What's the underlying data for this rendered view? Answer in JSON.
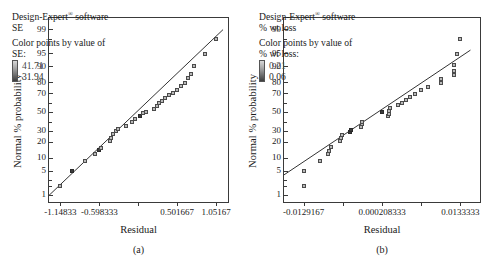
{
  "figure": {
    "panels": [
      {
        "id": "a",
        "caption": "(a)",
        "legend": {
          "software_pre": "Design-Expert",
          "software_sup": "®",
          "software_post": " software",
          "response": "SE",
          "color_by_line1": "Color points by value of",
          "color_by_line2": "SE:",
          "grad_high": "41.71",
          "grad_low": "31.94"
        },
        "chart_data": {
          "type": "scatter",
          "title": "Normal plot of residuals — SE",
          "xlabel": "Residual",
          "ylabel": "Normal % probability",
          "xticklabels": [
            "-1.14833",
            "-0.598333",
            "",
            "0.501667",
            "1.05167"
          ],
          "xtickvalues": [
            -1.14833,
            -0.598333,
            -0.0483333,
            0.501667,
            1.05167
          ],
          "yticklabels": [
            "99",
            "95",
            "90",
            "80",
            "70",
            "50",
            "30",
            "20",
            "10",
            "5",
            "1"
          ],
          "ytickvalues": [
            99,
            95,
            90,
            80,
            70,
            50,
            30,
            20,
            10,
            5,
            1
          ],
          "xlim": [
            -1.31,
            1.22
          ],
          "ylim": [
            0.6,
            99.6
          ],
          "grid": false,
          "legend_position": "top-left",
          "reference_line": {
            "x": [
              -1.31,
              1.15
            ],
            "y": [
              1.0,
              99.0
            ]
          },
          "points": [
            {
              "x": -1.14833,
              "y": 2.0,
              "shade": "mid"
            },
            {
              "x": -0.98,
              "y": 5.0,
              "shade": "dark"
            },
            {
              "x": -0.8,
              "y": 8.5,
              "shade": "mid"
            },
            {
              "x": -0.66,
              "y": 12.0,
              "shade": "mid"
            },
            {
              "x": -0.61,
              "y": 14.5,
              "shade": "dark"
            },
            {
              "x": -0.58,
              "y": 16.0,
              "shade": "mid"
            },
            {
              "x": -0.45,
              "y": 21.0,
              "shade": "mid"
            },
            {
              "x": -0.43,
              "y": 24.0,
              "shade": "mid"
            },
            {
              "x": -0.4,
              "y": 27.0,
              "shade": "mid"
            },
            {
              "x": -0.37,
              "y": 30.0,
              "shade": "mid"
            },
            {
              "x": -0.33,
              "y": 32.5,
              "shade": "mid"
            },
            {
              "x": -0.22,
              "y": 35.5,
              "shade": "mid"
            },
            {
              "x": -0.14,
              "y": 39.0,
              "shade": "mid"
            },
            {
              "x": -0.1,
              "y": 42.5,
              "shade": "mid"
            },
            {
              "x": -0.03,
              "y": 46.5,
              "shade": "dark"
            },
            {
              "x": 0.02,
              "y": 49.0,
              "shade": "mid"
            },
            {
              "x": 0.06,
              "y": 50.5,
              "shade": "mid"
            },
            {
              "x": 0.17,
              "y": 53.5,
              "shade": "mid"
            },
            {
              "x": 0.21,
              "y": 57.0,
              "shade": "mid"
            },
            {
              "x": 0.25,
              "y": 60.0,
              "shade": "mid"
            },
            {
              "x": 0.29,
              "y": 62.5,
              "shade": "mid"
            },
            {
              "x": 0.33,
              "y": 65.5,
              "shade": "mid"
            },
            {
              "x": 0.38,
              "y": 68.5,
              "shade": "mid"
            },
            {
              "x": 0.44,
              "y": 71.0,
              "shade": "mid"
            },
            {
              "x": 0.5,
              "y": 74.0,
              "shade": "mid"
            },
            {
              "x": 0.56,
              "y": 77.0,
              "shade": "mid"
            },
            {
              "x": 0.61,
              "y": 80.0,
              "shade": "mid"
            },
            {
              "x": 0.66,
              "y": 83.0,
              "shade": "mid"
            },
            {
              "x": 0.69,
              "y": 86.0,
              "shade": "mid"
            },
            {
              "x": 0.74,
              "y": 90.5,
              "shade": "mid"
            },
            {
              "x": 0.9,
              "y": 95.0,
              "shade": "mid"
            },
            {
              "x": 1.05167,
              "y": 98.0,
              "shade": "mid"
            }
          ]
        }
      },
      {
        "id": "b",
        "caption": "(b)",
        "legend": {
          "software_pre": "Design-Expert",
          "software_sup": "®",
          "software_post": " software",
          "response": "% wt loss",
          "color_by_line1": "Color points by value of",
          "color_by_line2": "% wt loss:",
          "grad_high": "0.21",
          "grad_low": "0.06"
        },
        "chart_data": {
          "type": "scatter",
          "title": "Normal plot of residuals — % wt loss",
          "xlabel": "Residual",
          "ylabel": "Normal % probability",
          "xticklabels": [
            "-0.0129167",
            "",
            "0.000208333",
            "",
            "0.0133333"
          ],
          "xtickvalues": [
            -0.0129167,
            -0.00635417,
            0.000208333,
            0.00677083,
            0.0133333
          ],
          "yticklabels": [
            "99",
            "95",
            "90",
            "80",
            "70",
            "50",
            "30",
            "20",
            "10",
            "5",
            "1"
          ],
          "ytickvalues": [
            99,
            95,
            90,
            80,
            70,
            50,
            30,
            20,
            10,
            5,
            1
          ],
          "xlim": [
            -0.0162,
            0.0166
          ],
          "ylim": [
            0.6,
            99.6
          ],
          "grid": false,
          "legend_position": "top-left",
          "reference_line": {
            "x": [
              -0.0162,
              0.015
            ],
            "y": [
              4.0,
              96.0
            ]
          },
          "points": [
            {
              "x": -0.01292,
              "y": 2.0,
              "shade": "mid"
            },
            {
              "x": -0.01292,
              "y": 5.0,
              "shade": "mid"
            },
            {
              "x": -0.0101,
              "y": 8.5,
              "shade": "mid"
            },
            {
              "x": -0.0088,
              "y": 12.0,
              "shade": "mid"
            },
            {
              "x": -0.0086,
              "y": 14.0,
              "shade": "mid"
            },
            {
              "x": -0.0084,
              "y": 16.5,
              "shade": "mid"
            },
            {
              "x": -0.0068,
              "y": 21.0,
              "shade": "mid"
            },
            {
              "x": -0.0066,
              "y": 24.0,
              "shade": "mid"
            },
            {
              "x": -0.0065,
              "y": 26.5,
              "shade": "mid"
            },
            {
              "x": -0.0052,
              "y": 29.5,
              "shade": "dark"
            },
            {
              "x": -0.005,
              "y": 31.5,
              "shade": "dark"
            },
            {
              "x": -0.0033,
              "y": 34.5,
              "shade": "mid"
            },
            {
              "x": -0.0032,
              "y": 37.0,
              "shade": "mid"
            },
            {
              "x": -0.0031,
              "y": 39.5,
              "shade": "mid"
            },
            {
              "x": 0.00021,
              "y": 50.0,
              "shade": "dark"
            },
            {
              "x": 0.0012,
              "y": 46.0,
              "shade": "mid"
            },
            {
              "x": 0.0013,
              "y": 48.5,
              "shade": "mid"
            },
            {
              "x": 0.0014,
              "y": 52.0,
              "shade": "mid"
            },
            {
              "x": 0.0015,
              "y": 55.0,
              "shade": "mid"
            },
            {
              "x": 0.0028,
              "y": 58.0,
              "shade": "mid"
            },
            {
              "x": 0.0035,
              "y": 61.0,
              "shade": "mid"
            },
            {
              "x": 0.0042,
              "y": 64.0,
              "shade": "mid"
            },
            {
              "x": 0.0049,
              "y": 67.0,
              "shade": "mid"
            },
            {
              "x": 0.0058,
              "y": 70.0,
              "shade": "mid"
            },
            {
              "x": 0.0068,
              "y": 73.5,
              "shade": "mid"
            },
            {
              "x": 0.0079,
              "y": 76.5,
              "shade": "mid"
            },
            {
              "x": 0.01,
              "y": 80.0,
              "shade": "mid"
            },
            {
              "x": 0.0101,
              "y": 82.5,
              "shade": "mid"
            },
            {
              "x": 0.0122,
              "y": 85.5,
              "shade": "mid"
            },
            {
              "x": 0.01225,
              "y": 88.0,
              "shade": "mid"
            },
            {
              "x": 0.0123,
              "y": 91.0,
              "shade": "mid"
            },
            {
              "x": 0.0128,
              "y": 95.0,
              "shade": "mid"
            },
            {
              "x": 0.01333,
              "y": 98.0,
              "shade": "mid"
            }
          ]
        }
      }
    ]
  }
}
